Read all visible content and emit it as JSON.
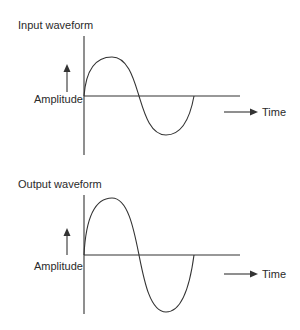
{
  "panels": [
    {
      "title": "Input waveform",
      "y_label": "Amplitude",
      "x_label": "Time",
      "amplitude": 39,
      "baseline_y": 96
    },
    {
      "title": "Output waveform",
      "y_label": "Amplitude",
      "x_label": "Time",
      "amplitude": 57,
      "baseline_y": 255
    }
  ],
  "colors": {
    "line": "#333333",
    "background": "#ffffff"
  }
}
